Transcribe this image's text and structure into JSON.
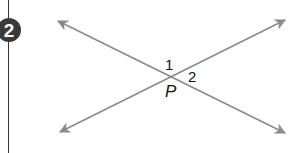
{
  "problem": {
    "number": "2"
  },
  "figure": {
    "point_label": "P",
    "angle_labels": [
      "1",
      "2"
    ],
    "line_color": "#8a8a8a",
    "badge_color": "#3a3a3a"
  }
}
